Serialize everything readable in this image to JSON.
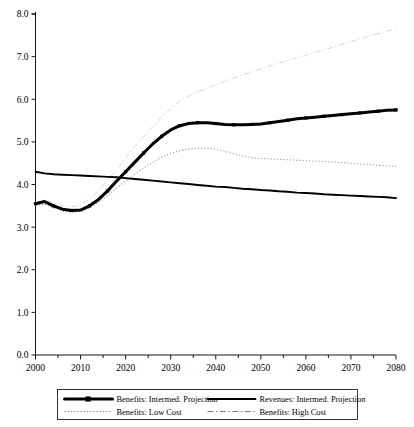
{
  "chart_data": {
    "type": "line",
    "title": "",
    "subtitle": "",
    "xlabel": "",
    "ylabel": "",
    "xlim": [
      2000,
      2080
    ],
    "ylim": [
      0.0,
      8.0
    ],
    "grid": false,
    "legend_position": "bottom",
    "y_ticks": [
      "0.0",
      "1.0",
      "2.0",
      "3.0",
      "4.0",
      "5.0",
      "6.0",
      "7.0",
      "8.0"
    ],
    "y_tick_values": [
      0.0,
      1.0,
      2.0,
      3.0,
      4.0,
      5.0,
      6.0,
      7.0,
      8.0
    ],
    "x_ticks": [
      "2000",
      "2010",
      "2020",
      "2030",
      "2040",
      "2050",
      "2060",
      "2070",
      "2080"
    ],
    "x_tick_values": [
      2000,
      2010,
      2020,
      2030,
      2040,
      2050,
      2060,
      2070,
      2080
    ],
    "x_minor_tick_values": [
      2005,
      2015,
      2025,
      2035,
      2045,
      2055,
      2065,
      2075
    ],
    "x": [
      2000,
      2002,
      2004,
      2006,
      2008,
      2010,
      2012,
      2014,
      2016,
      2018,
      2020,
      2022,
      2024,
      2026,
      2028,
      2030,
      2032,
      2034,
      2036,
      2038,
      2040,
      2042,
      2044,
      2046,
      2048,
      2050,
      2052,
      2054,
      2056,
      2058,
      2060,
      2062,
      2064,
      2066,
      2068,
      2070,
      2072,
      2074,
      2076,
      2078,
      2080
    ],
    "series": [
      {
        "name": "Benefits: Intermed. Projection",
        "style": "thick-marker",
        "color": "#000000",
        "values": [
          3.55,
          3.6,
          3.5,
          3.42,
          3.39,
          3.4,
          3.5,
          3.65,
          3.85,
          4.08,
          4.3,
          4.52,
          4.74,
          4.95,
          5.13,
          5.28,
          5.38,
          5.43,
          5.45,
          5.45,
          5.43,
          5.41,
          5.4,
          5.4,
          5.41,
          5.42,
          5.45,
          5.48,
          5.51,
          5.54,
          5.56,
          5.58,
          5.6,
          5.62,
          5.64,
          5.66,
          5.68,
          5.7,
          5.72,
          5.74,
          5.75
        ]
      },
      {
        "name": "Revenues: Intermed. Projection",
        "style": "thick-solid",
        "color": "#000000",
        "values": [
          4.3,
          4.26,
          4.24,
          4.23,
          4.22,
          4.21,
          4.2,
          4.19,
          4.18,
          4.17,
          4.15,
          4.13,
          4.11,
          4.09,
          4.07,
          4.05,
          4.03,
          4.01,
          3.99,
          3.97,
          3.95,
          3.94,
          3.92,
          3.9,
          3.89,
          3.87,
          3.86,
          3.84,
          3.83,
          3.81,
          3.8,
          3.79,
          3.77,
          3.76,
          3.75,
          3.74,
          3.73,
          3.72,
          3.71,
          3.7,
          3.68
        ]
      },
      {
        "name": "Benefits: Low Cost",
        "style": "dotted",
        "color": "#9a9a9a",
        "values": [
          3.5,
          3.54,
          3.45,
          3.38,
          3.35,
          3.36,
          3.45,
          3.58,
          3.74,
          3.92,
          4.08,
          4.24,
          4.39,
          4.52,
          4.64,
          4.73,
          4.79,
          4.83,
          4.85,
          4.85,
          4.83,
          4.78,
          4.72,
          4.67,
          4.63,
          4.61,
          4.6,
          4.59,
          4.58,
          4.57,
          4.56,
          4.55,
          4.54,
          4.53,
          4.51,
          4.5,
          4.48,
          4.47,
          4.45,
          4.44,
          4.42
        ]
      },
      {
        "name": "Benefits: High Cost",
        "style": "dashdot",
        "color": "#d8d8d8",
        "values": [
          3.58,
          3.64,
          3.56,
          3.5,
          3.48,
          3.52,
          3.66,
          3.86,
          4.1,
          4.36,
          4.62,
          4.88,
          5.12,
          5.36,
          5.58,
          5.78,
          5.96,
          6.08,
          6.18,
          6.26,
          6.34,
          6.42,
          6.5,
          6.57,
          6.64,
          6.71,
          6.78,
          6.85,
          6.91,
          6.97,
          7.03,
          7.1,
          7.16,
          7.22,
          7.29,
          7.35,
          7.42,
          7.48,
          7.54,
          7.6,
          7.65
        ]
      }
    ],
    "legend": [
      {
        "label": "Benefits: Intermed. Projection",
        "style": "thick-marker",
        "color": "#000000"
      },
      {
        "label": "Revenues: Intermed. Projection",
        "style": "thick-solid",
        "color": "#000000"
      },
      {
        "label": "Benefits: Low Cost",
        "style": "dotted",
        "color": "#7d7d7d"
      },
      {
        "label": "Benefits: High Cost",
        "style": "dashdot",
        "color": "#7d7d7d"
      }
    ]
  }
}
